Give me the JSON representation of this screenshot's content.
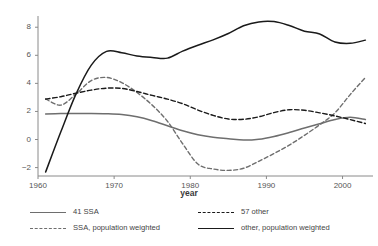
{
  "chart_data": {
    "type": "line",
    "title": "",
    "xlabel": "year",
    "ylabel": "",
    "xlim": [
      1960,
      2004
    ],
    "ylim": [
      -2.6,
      8.8
    ],
    "xticks": [
      1960,
      1970,
      1980,
      1990,
      2000
    ],
    "yticks": [
      -2,
      0,
      2,
      4,
      6,
      8
    ],
    "grid": false,
    "legend_position": "bottom",
    "series": [
      {
        "name": "41 SSA",
        "style": "solid",
        "color": "#6e6e6e",
        "x": [
          1961,
          1963,
          1965,
          1967,
          1969,
          1971,
          1973,
          1975,
          1977,
          1979,
          1981,
          1983,
          1985,
          1987,
          1989,
          1991,
          1993,
          1995,
          1997,
          1999,
          2001,
          2003
        ],
        "y": [
          1.82,
          1.85,
          1.86,
          1.86,
          1.84,
          1.78,
          1.62,
          1.34,
          0.98,
          0.62,
          0.34,
          0.16,
          0.06,
          -0.04,
          0.02,
          0.22,
          0.5,
          0.82,
          1.12,
          1.42,
          1.58,
          1.42
        ]
      },
      {
        "name": "SSA, population weighted",
        "style": "dashed",
        "color": "#6e6e6e",
        "x": [
          1961,
          1963,
          1965,
          1967,
          1969,
          1971,
          1973,
          1975,
          1977,
          1979,
          1981,
          1983,
          1985,
          1987,
          1989,
          1991,
          1993,
          1995,
          1997,
          1999,
          2001,
          2003
        ],
        "y": [
          2.9,
          2.45,
          3.25,
          4.2,
          4.42,
          4.05,
          3.35,
          2.45,
          1.3,
          -0.3,
          -1.75,
          -2.1,
          -2.2,
          -2.05,
          -1.55,
          -1.0,
          -0.4,
          0.3,
          1.05,
          1.9,
          3.2,
          4.42
        ]
      },
      {
        "name": "57 other",
        "style": "dashed",
        "color": "#1a1a1a",
        "x": [
          1961,
          1963,
          1965,
          1967,
          1969,
          1971,
          1973,
          1975,
          1977,
          1979,
          1981,
          1983,
          1985,
          1987,
          1989,
          1991,
          1993,
          1995,
          1997,
          1999,
          2001,
          2003
        ],
        "y": [
          2.88,
          3.05,
          3.3,
          3.52,
          3.66,
          3.64,
          3.42,
          3.14,
          2.88,
          2.55,
          2.1,
          1.72,
          1.46,
          1.44,
          1.62,
          1.92,
          2.12,
          2.08,
          1.9,
          1.68,
          1.42,
          1.14
        ]
      },
      {
        "name": "other, population weighted",
        "style": "solid",
        "color": "#1a1a1a",
        "x": [
          1961,
          1963,
          1965,
          1967,
          1969,
          1971,
          1973,
          1975,
          1977,
          1979,
          1981,
          1983,
          1985,
          1987,
          1989,
          1991,
          1993,
          1995,
          1997,
          1999,
          2001,
          2003
        ],
        "y": [
          -2.32,
          0.55,
          3.25,
          5.3,
          6.28,
          6.18,
          5.95,
          5.85,
          5.8,
          6.3,
          6.72,
          7.1,
          7.55,
          8.1,
          8.38,
          8.4,
          8.12,
          7.72,
          7.52,
          6.95,
          6.85,
          7.08
        ]
      }
    ]
  },
  "legend": {
    "items": [
      {
        "label": "41 SSA",
        "key": "k-solid-gray"
      },
      {
        "label": "57 other",
        "key": "k-dash-black"
      },
      {
        "label": "SSA, population weighted",
        "key": "k-dash-gray"
      },
      {
        "label": "other, population weighted",
        "key": "k-solid-black"
      }
    ]
  },
  "axis": {
    "x_title": "year",
    "ytick_labels": [
      "8",
      "6",
      "4",
      "2",
      "0",
      "−2"
    ],
    "xtick_labels": [
      "1960",
      "1970",
      "1980",
      "1990",
      "2000"
    ]
  }
}
